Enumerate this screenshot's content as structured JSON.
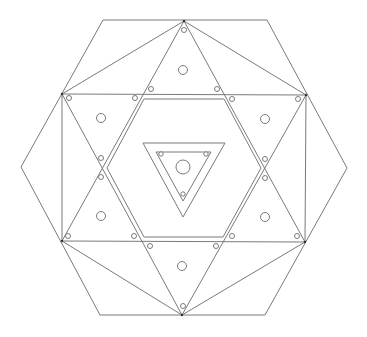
{
  "diagram": {
    "title": "",
    "stroke_color": "#7a7a7a",
    "background_color": "#ffffff",
    "shapes": [
      {
        "name": "outer-hexagon",
        "kind": "polygon"
      },
      {
        "name": "upward-triangle",
        "kind": "polygon"
      },
      {
        "name": "downward-triangle",
        "kind": "polygon"
      },
      {
        "name": "inner-hexagon",
        "kind": "polygon"
      },
      {
        "name": "center-outer-triangle",
        "kind": "polygon"
      },
      {
        "name": "center-inner-triangle",
        "kind": "polygon"
      },
      {
        "name": "center-circle",
        "kind": "circle"
      }
    ],
    "labels": []
  }
}
